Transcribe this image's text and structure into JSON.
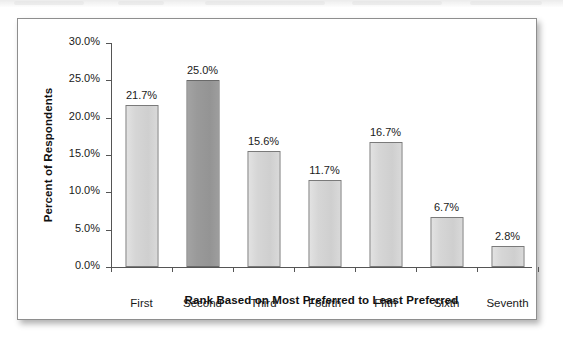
{
  "figure": {
    "background_color": "#ffffff",
    "border_color": "#8e8e8e"
  },
  "chart_data": {
    "type": "bar",
    "title": "",
    "categories": [
      "First",
      "Second",
      "Third",
      "Fourth",
      "Fifth",
      "Sixth",
      "Seventh"
    ],
    "values": [
      21.7,
      25.0,
      15.6,
      11.7,
      16.7,
      6.7,
      2.8
    ],
    "data_labels": [
      "21.7%",
      "25.0%",
      "15.6%",
      "11.7%",
      "16.7%",
      "6.7%",
      "2.8%"
    ],
    "highlighted_index": 1,
    "bar_color": "#d6d6d6",
    "highlight_color": "#9a9a9a",
    "bar_border_color": "#7a7a7a",
    "xlabel": "Rank Based on Most Preferred to Least Preferred",
    "ylabel": "Percent of Respondents",
    "ylim": [
      0,
      30
    ],
    "ytick_values": [
      0,
      5,
      10,
      15,
      20,
      25,
      30
    ],
    "ytick_labels": [
      "0.0%",
      "5.0%",
      "10.0%",
      "15.0%",
      "20.0%",
      "25.0%",
      "30.0%"
    ],
    "grid": false,
    "legend": false,
    "legend_position": "none",
    "axis_color": "#555555"
  }
}
